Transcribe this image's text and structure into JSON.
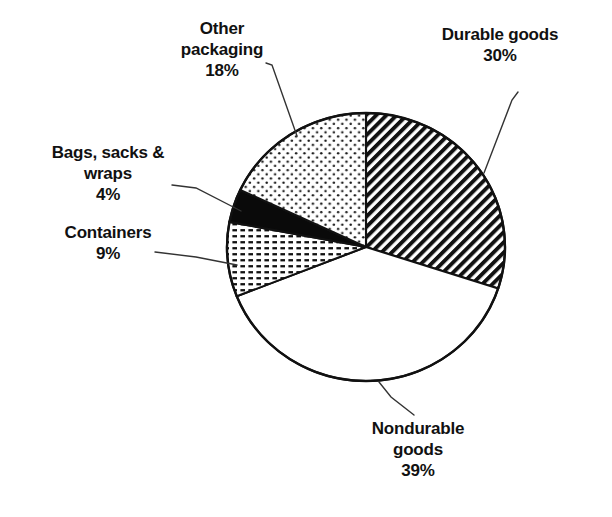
{
  "chart_data": {
    "type": "pie",
    "title": "",
    "subtitle": "",
    "xlabel": "",
    "ylabel": "",
    "legend_position": "none",
    "grid": false,
    "units": "percent",
    "total": 100,
    "start_angle_deg": 0,
    "direction": "clockwise",
    "categories": [
      "Durable goods",
      "Nondurable goods",
      "Containers",
      "Bags, sacks & wraps",
      "Other packaging"
    ],
    "values": [
      30,
      39,
      9,
      4,
      18
    ],
    "slices": [
      {
        "label": "Durable goods",
        "value": 30,
        "value_text": "30%",
        "fill": "diagonal-hatch",
        "color": "#000000",
        "start_deg": 0,
        "end_deg": 108
      },
      {
        "label": "Nondurable goods",
        "value": 39,
        "value_text": "39%",
        "fill": "blank-white",
        "color": "#ffffff",
        "start_deg": 108,
        "end_deg": 248.4
      },
      {
        "label": "Containers",
        "value": 9,
        "value_text": "9%",
        "fill": "horizontal-dash",
        "color": "#000000",
        "start_deg": 248.4,
        "end_deg": 280.8
      },
      {
        "label": "Bags, sacks & wraps",
        "value": 4,
        "value_text": "4%",
        "fill": "solid-black",
        "color": "#000000",
        "start_deg": 280.8,
        "end_deg": 295.2
      },
      {
        "label": "Other packaging",
        "value": 18,
        "value_text": "18%",
        "fill": "sparse-dots",
        "color": "#000000",
        "start_deg": 295.2,
        "end_deg": 360
      }
    ]
  },
  "labels": {
    "other_packaging": "Other\npackaging\n18%",
    "durable_goods": "Durable goods\n30%",
    "bags_sacks_wraps": "Bags, sacks &\nwraps\n4%",
    "containers": "Containers\n9%",
    "nondurable_goods": "Nondurable\ngoods\n39%"
  },
  "style": {
    "outline_color": "#111111",
    "background": "#ffffff",
    "leader_color": "#333333"
  }
}
